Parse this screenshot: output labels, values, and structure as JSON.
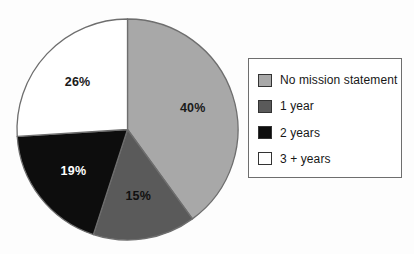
{
  "chart_data": {
    "type": "pie",
    "title": "",
    "subtitle": "",
    "labels": [
      "No mission statement",
      "1 year",
      "2 years",
      "3 + years"
    ],
    "values": [
      40,
      15,
      19,
      26
    ],
    "value_labels": [
      "40%",
      "15%",
      "19%",
      "26%"
    ],
    "colors": [
      "#a8a8a8",
      "#5a5a5a",
      "#0d0d0d",
      "#ffffff"
    ],
    "label_text_colors": [
      "#1a1a1a",
      "#101010",
      "#ffffff",
      "#1a1a1a"
    ],
    "start_angle_deg": 0,
    "direction": "clockwise",
    "legend_position": "right",
    "grid": false,
    "units": "percent",
    "slice_border_color": "#6e6e6e",
    "background_color": "#fdfdfd"
  },
  "legend": {
    "items": [
      {
        "label": "No mission statement",
        "color": "#a8a8a8"
      },
      {
        "label": "1 year",
        "color": "#5a5a5a"
      },
      {
        "label": "2 years",
        "color": "#0d0d0d"
      },
      {
        "label": "3 + years",
        "color": "#ffffff"
      }
    ]
  },
  "pie": {
    "slices": [
      {
        "name": "No mission statement",
        "percent_label": "40%"
      },
      {
        "name": "1 year",
        "percent_label": "15%"
      },
      {
        "name": "2 years",
        "percent_label": "19%"
      },
      {
        "name": "3 + years",
        "percent_label": "26%"
      }
    ]
  }
}
